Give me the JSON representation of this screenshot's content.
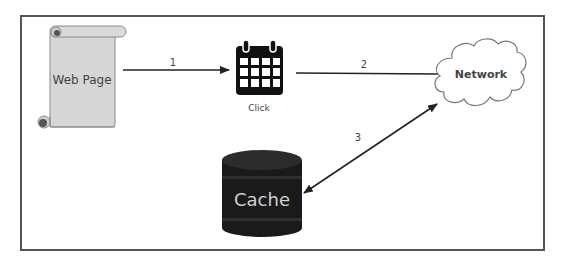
{
  "diagram": {
    "nodes": {
      "web_page": {
        "label": "Web Page",
        "shape": "scroll",
        "fill": "#d6d6d6"
      },
      "click": {
        "label": "Click",
        "shape": "calendar-icon",
        "fill": "#111111"
      },
      "network": {
        "label": "Network",
        "shape": "cloud",
        "fill": "#ffffff"
      },
      "cache": {
        "label": "Cache",
        "shape": "cylinder",
        "fill": "#1a1a1a",
        "text_color": "#d0d0d0"
      }
    },
    "edges": [
      {
        "id": "1",
        "label": "1",
        "from": "Web Page",
        "to": "Click",
        "arrow": "end"
      },
      {
        "id": "2",
        "label": "2",
        "from": "Click",
        "to": "Network",
        "arrow": "none"
      },
      {
        "id": "3",
        "label": "3",
        "from": "Cache",
        "to": "Network",
        "arrow": "both"
      }
    ],
    "colors": {
      "frame": "#555555",
      "line": "#222222"
    }
  }
}
